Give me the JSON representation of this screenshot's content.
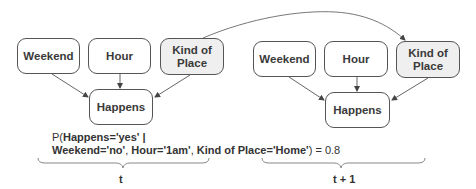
{
  "diagram": {
    "slices": [
      {
        "label": "t",
        "nodes": {
          "weekend": {
            "label": "Weekend"
          },
          "hour": {
            "label": "Hour"
          },
          "kind_of_place": {
            "label_line1": "Kind of",
            "label_line2": "Place",
            "shaded": true
          },
          "happens": {
            "label": "Happens"
          }
        }
      },
      {
        "label": "t + 1",
        "nodes": {
          "weekend": {
            "label": "Weekend"
          },
          "hour": {
            "label": "Hour"
          },
          "kind_of_place": {
            "label_line1": "Kind of",
            "label_line2": "Place",
            "shaded": true
          },
          "happens": {
            "label": "Happens"
          }
        }
      }
    ],
    "edges": [
      {
        "from": "t.weekend",
        "to": "t.happens"
      },
      {
        "from": "t.hour",
        "to": "t.happens"
      },
      {
        "from": "t.kind_of_place",
        "to": "t.happens"
      },
      {
        "from": "t+1.weekend",
        "to": "t+1.happens"
      },
      {
        "from": "t+1.hour",
        "to": "t+1.happens"
      },
      {
        "from": "t+1.kind_of_place",
        "to": "t+1.happens"
      },
      {
        "from": "t.kind_of_place",
        "to": "t+1.kind_of_place",
        "style": "curved"
      }
    ],
    "formula": {
      "p_open": "P(",
      "happens_eq": "Happens=",
      "yes": "'yes'",
      "bar": " |",
      "weekend_eq": "Weekend=",
      "no": "'no'",
      "sep1": ", ",
      "hour_eq": "Hour=",
      "one_am": "'1am'",
      "sep2": ", ",
      "kop_eq": "Kind of Place=",
      "home": "'Home'",
      "close": ") = 0.8"
    }
  }
}
